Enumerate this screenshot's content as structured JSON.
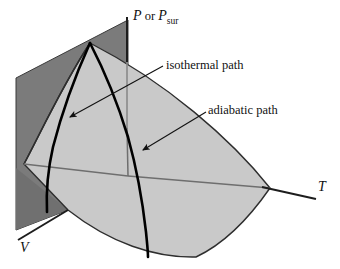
{
  "figure": {
    "type": "3d-surface-diagram",
    "background_color": "#ffffff",
    "surfaces": {
      "back_plane_color": "#7b7b7b",
      "top_surface_color": "#c9c9c9",
      "outline_color": "#2b2b2b",
      "inner_line_color": "#6e6e6e",
      "curve_color": "#000000"
    }
  },
  "axes": {
    "pressure": {
      "name": "pressure-axis",
      "symbol": "P",
      "conjunction": " or ",
      "symbol2": "P",
      "subscript": "sur",
      "full_label": "P or Psur",
      "orientation": "vertical"
    },
    "temperature": {
      "name": "temperature-axis",
      "symbol": "T",
      "orientation": "right"
    },
    "volume": {
      "name": "volume-axis",
      "symbol": "V",
      "orientation": "lower-left"
    }
  },
  "annotations": [
    {
      "id": "isothermal",
      "label": "isothermal path",
      "arrow_from": [
        163,
        66
      ],
      "arrow_to": [
        67,
        118
      ]
    },
    {
      "id": "adiabatic",
      "label": "adiabatic path",
      "arrow_from": [
        206,
        112
      ],
      "arrow_to": [
        140,
        152
      ]
    }
  ]
}
